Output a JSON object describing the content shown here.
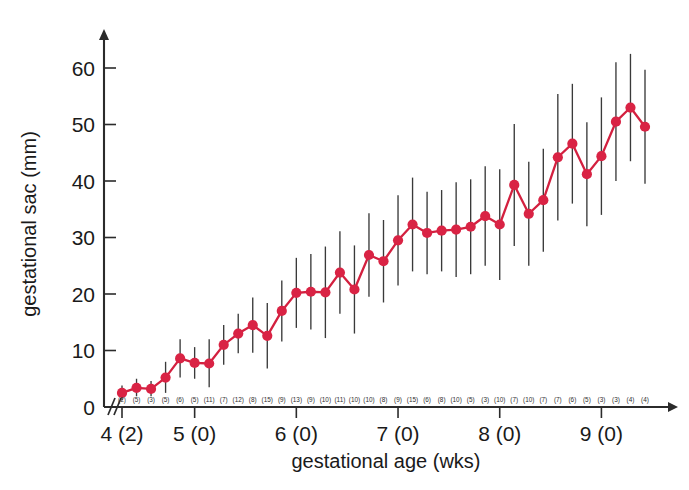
{
  "chart_data": {
    "type": "line",
    "title": "",
    "xlabel": "gestational age (wks)",
    "ylabel": "gestational sac (mm)",
    "ylim": [
      0,
      65
    ],
    "yticks": [
      0,
      10,
      20,
      30,
      40,
      50,
      60
    ],
    "xtick_labels": [
      "4 (2)",
      "5 (0)",
      "6 (0)",
      "7 (0)",
      "8 (0)",
      "9 (0)"
    ],
    "xtick_weeks": [
      4.2857,
      5.0,
      6.0,
      7.0,
      8.0,
      9.0
    ],
    "grid": false,
    "legend": null,
    "marker_color": "#d92344",
    "line_color": "#d3203f",
    "errorbar_color": "#3a3a3a",
    "series": [
      {
        "name": "mean gestational sac diameter",
        "x_weeks": [
          4.2857,
          4.4286,
          4.5714,
          4.7143,
          4.8571,
          5.0,
          5.1429,
          5.2857,
          5.4286,
          5.5714,
          5.7143,
          5.8571,
          6.0,
          6.1429,
          6.2857,
          6.4286,
          6.5714,
          6.7143,
          6.8571,
          7.0,
          7.1429,
          7.2857,
          7.4286,
          7.5714,
          7.7143,
          7.8571,
          8.0,
          8.1429,
          8.2857,
          8.4286,
          8.5714,
          8.7143,
          8.8571,
          9.0,
          9.1429,
          9.2857,
          9.4286
        ],
        "values": [
          2.5,
          3.4,
          3.2,
          5.2,
          8.6,
          7.8,
          7.7,
          11.0,
          13.0,
          14.5,
          12.6,
          17.0,
          20.2,
          20.4,
          20.3,
          23.8,
          20.8,
          26.9,
          25.8,
          29.5,
          32.3,
          30.8,
          31.2,
          31.4,
          31.9,
          33.8,
          32.3,
          39.3,
          34.2,
          36.6,
          44.2,
          46.6,
          41.2,
          44.4,
          50.5,
          53.0,
          49.6,
          46.4,
          59.0
        ],
        "error_low": [
          1.2,
          1.9,
          1.9,
          2.5,
          5.2,
          5.0,
          3.5,
          7.5,
          9.5,
          9.6,
          6.8,
          11.6,
          14.0,
          13.7,
          12.2,
          16.5,
          13.0,
          19.5,
          18.5,
          21.5,
          24.0,
          23.5,
          24.0,
          23.0,
          23.5,
          25.0,
          22.5,
          28.5,
          25.0,
          27.5,
          33.0,
          36.0,
          32.0,
          34.0,
          40.0,
          43.5,
          39.5,
          31.8,
          51.5
        ],
        "error_high": [
          3.8,
          5.0,
          4.6,
          8.0,
          12.0,
          10.6,
          12.0,
          14.5,
          16.5,
          19.4,
          18.4,
          22.4,
          26.4,
          27.1,
          28.4,
          31.1,
          28.6,
          34.3,
          33.1,
          37.5,
          40.6,
          38.1,
          38.4,
          39.8,
          40.3,
          42.6,
          42.1,
          50.1,
          43.4,
          45.7,
          55.4,
          57.2,
          50.4,
          54.8,
          61.0,
          62.5,
          59.7,
          61.0,
          66.5
        ],
        "counts": [
          2,
          5,
          3,
          5,
          6,
          5,
          11,
          7,
          12,
          8,
          15,
          9,
          13,
          9,
          10,
          11,
          10,
          10,
          8,
          9,
          15,
          6,
          8,
          10,
          5,
          3,
          10,
          7,
          10,
          7,
          7,
          6,
          5,
          3,
          3,
          4,
          4,
          4,
          5
        ]
      }
    ]
  }
}
